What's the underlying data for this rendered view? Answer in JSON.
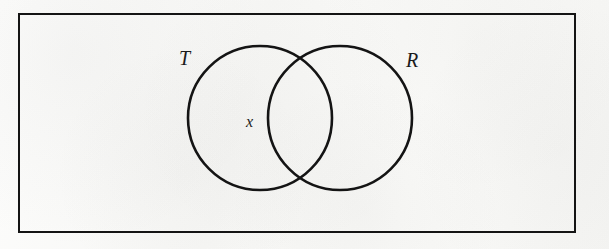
{
  "figure": {
    "type": "venn-diagram",
    "background_color": "#fbfbfa",
    "ink_color": "#141414",
    "universal_set": {
      "shape": "rectangle",
      "x": 19,
      "y": 14,
      "width": 556,
      "height": 218,
      "stroke_width": 2
    },
    "circles": [
      {
        "set_label": "T",
        "cx": 260,
        "cy": 118,
        "r": 72,
        "stroke_width": 2.6
      },
      {
        "set_label": "R",
        "cx": 340,
        "cy": 118,
        "r": 72,
        "stroke_width": 2.6
      }
    ],
    "labels": {
      "left_set": "T",
      "right_set": "R",
      "region_marker": "x"
    },
    "region_marker": {
      "text": "x",
      "x": 251,
      "y": 122,
      "region": "T-only"
    }
  }
}
